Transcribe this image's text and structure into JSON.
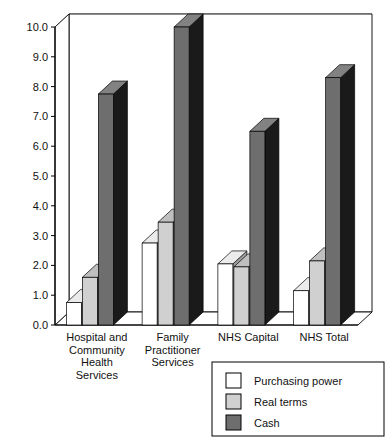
{
  "chart_data": {
    "type": "bar",
    "title": "",
    "subtitle": "",
    "xlabel": "",
    "ylabel": "",
    "ylim": [
      0.0,
      10.0
    ],
    "ytick_step": 1.0,
    "ytick_labels": [
      "0.0",
      "1.0",
      "2.0",
      "3.0",
      "4.0",
      "5.0",
      "6.0",
      "7.0",
      "8.0",
      "9.0",
      "10.0"
    ],
    "ytick_values": [
      0.0,
      1.0,
      2.0,
      3.0,
      4.0,
      5.0,
      6.0,
      7.0,
      8.0,
      9.0,
      10.0
    ],
    "grid": "horizontal",
    "style": "3d-grouped-bars",
    "legend_position": "bottom-right",
    "categories": [
      "Hospital and Community Health Services",
      "Family Practitioner Services",
      "NHS Capital",
      "NHS Total"
    ],
    "category_label_lines": [
      [
        "Hospital and",
        "Community",
        "Health",
        "Services"
      ],
      [
        "Family",
        "Practitioner",
        "Services"
      ],
      [
        "NHS Capital"
      ],
      [
        "NHS Total"
      ]
    ],
    "series": [
      {
        "name": "Purchasing power",
        "color": "#ffffff",
        "values": [
          0.75,
          2.75,
          2.05,
          1.15
        ]
      },
      {
        "name": "Real terms",
        "color": "#d0d0d0",
        "values": [
          1.6,
          3.45,
          1.95,
          2.15
        ]
      },
      {
        "name": "Cash",
        "color": "#6e6e6e",
        "values": [
          7.75,
          10.0,
          6.5,
          8.3
        ]
      }
    ],
    "legend": [
      {
        "label": "Purchasing power",
        "swatch": "#ffffff"
      },
      {
        "label": "Real terms",
        "swatch": "#d0d0d0"
      },
      {
        "label": "Cash",
        "swatch": "#6e6e6e"
      }
    ],
    "colors": {
      "axis": "#000000",
      "grid": "#888888",
      "frame": "#000000",
      "bar_purchasing_power": "#ffffff",
      "bar_real_terms": "#d0d0d0",
      "bar_cash": "#6e6e6e",
      "bar_side_dark": "#1a1a1a",
      "background": "#ffffff"
    }
  }
}
